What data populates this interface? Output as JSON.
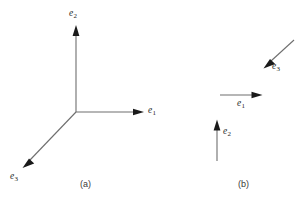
{
  "figure": {
    "background_color": "#ffffff",
    "line_color": "#6e6e6e",
    "arrowhead_color": "#1a1a1a",
    "label_color": "#262626",
    "panels": [
      {
        "id": "a",
        "caption": "(a)",
        "caption_pos": {
          "x": 80,
          "y": 181
        },
        "description": "orthonormal basis triad drawn from a common origin",
        "origin": {
          "x": 76,
          "y": 112
        },
        "vectors": [
          {
            "name": "e2",
            "label_base": "e",
            "label_sub": "2",
            "label_pos": {
              "x": 70,
              "y": 9
            },
            "from": {
              "x": 76,
              "y": 112
            },
            "to": {
              "x": 76,
              "y": 26
            },
            "direction": "up"
          },
          {
            "name": "e1",
            "label_base": "e",
            "label_sub": "1",
            "label_pos": {
              "x": 148,
              "y": 107
            },
            "from": {
              "x": 76,
              "y": 112
            },
            "to": {
              "x": 143,
              "y": 112
            },
            "direction": "right"
          },
          {
            "name": "e3",
            "label_base": "e",
            "label_sub": "3",
            "label_pos": {
              "x": 10,
              "y": 174
            },
            "from": {
              "x": 76,
              "y": 112
            },
            "to": {
              "x": 23,
              "y": 167
            },
            "direction": "down-left"
          }
        ]
      },
      {
        "id": "b",
        "caption": "(b)",
        "caption_pos": {
          "x": 238,
          "y": 181
        },
        "description": "same basis vectors drawn as free vectors at separate locations",
        "vectors": [
          {
            "name": "e3",
            "label_base": "e",
            "label_sub": "3",
            "label_pos": {
              "x": 272,
              "y": 63
            },
            "from": {
              "x": 294,
              "y": 40
            },
            "to": {
              "x": 264,
              "y": 68
            },
            "direction": "down-left"
          },
          {
            "name": "e1",
            "label_base": "e",
            "label_sub": "1",
            "label_pos": {
              "x": 238,
              "y": 100
            },
            "from": {
              "x": 220,
              "y": 95
            },
            "to": {
              "x": 262,
              "y": 95
            },
            "direction": "right"
          },
          {
            "name": "e2",
            "label_base": "e",
            "label_sub": "2",
            "label_pos": {
              "x": 224,
              "y": 128
            },
            "from": {
              "x": 217,
              "y": 161
            },
            "to": {
              "x": 217,
              "y": 120
            },
            "direction": "up"
          }
        ]
      }
    ]
  }
}
